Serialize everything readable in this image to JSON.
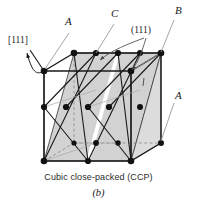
{
  "figure": {
    "caption": "Cubic close-packed (CCP)",
    "subcaption": "(b)",
    "structure_type": "face-centered cubic unit cell with (111) close-packed planes",
    "colors": {
      "line": "#1a1a1a",
      "plane_fill": "#d2d2d2",
      "plane_fill_light": "#dcdcdc",
      "atom": "#111111",
      "leader": "#8a8a8a",
      "hidden_edge": "#999999",
      "background": "#ffffff"
    }
  },
  "labels": {
    "direction": "[111]",
    "plane": "(111)",
    "layer_a_top": "A",
    "layer_a_right": "A",
    "layer_b": "B",
    "layer_c": "C"
  },
  "label_positions": {
    "direction": {
      "x": 8,
      "y": 41
    },
    "layer_a_top": {
      "x": 66,
      "y": 22
    },
    "layer_c": {
      "x": 112,
      "y": 14
    },
    "plane": {
      "x": 128,
      "y": 27
    },
    "layer_b": {
      "x": 176,
      "y": 11
    },
    "layer_a_right": {
      "x": 176,
      "y": 96
    }
  },
  "geometry": {
    "cube_vertices": {
      "front_bottom_left": {
        "x": 44,
        "y": 161
      },
      "front_bottom_right": {
        "x": 131,
        "y": 161
      },
      "front_top_left": {
        "x": 44,
        "y": 71
      },
      "front_top_right": {
        "x": 131,
        "y": 71
      },
      "back_bottom_left": {
        "x": 74,
        "y": 143
      },
      "back_bottom_right": {
        "x": 161,
        "y": 143
      },
      "back_top_left": {
        "x": 74,
        "y": 53
      },
      "back_top_right": {
        "x": 161,
        "y": 53
      }
    },
    "plane_count": 3,
    "plane_family": "(111)",
    "stacking_sequence": "ABCABC"
  }
}
